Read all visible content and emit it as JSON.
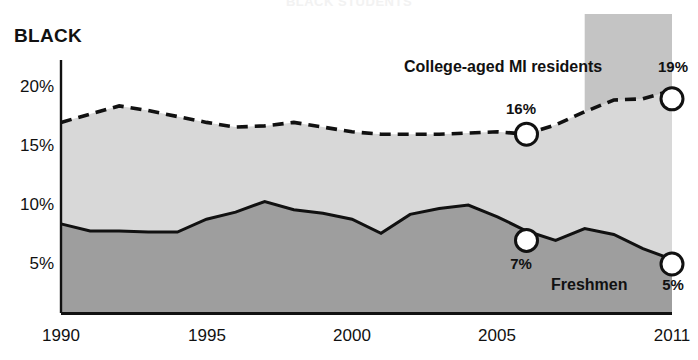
{
  "chart_data": {
    "type": "area",
    "title": "BLACK STUDENTS",
    "group_label": "BLACK",
    "xlabel": "",
    "ylabel": "",
    "x": [
      1990,
      1991,
      1992,
      1993,
      1994,
      1995,
      1996,
      1997,
      1998,
      1999,
      2000,
      2001,
      2002,
      2003,
      2004,
      2005,
      2006,
      2007,
      2008,
      2009,
      2010,
      2011
    ],
    "xlim": [
      1990,
      2011
    ],
    "ylim": [
      0,
      22
    ],
    "yticks": [
      5,
      10,
      15,
      20
    ],
    "ytick_labels": [
      "5%",
      "10%",
      "15%",
      "20%"
    ],
    "xticks": [
      1990,
      1995,
      2000,
      2005,
      2011
    ],
    "xtick_labels": [
      "1990",
      "1995",
      "2000",
      "2005",
      "2011"
    ],
    "grid": false,
    "legend_position": "inline-annotations",
    "series": [
      {
        "name": "College-aged MI residents",
        "style": "dashed",
        "color": "#111111",
        "fill": "#d8d8d8",
        "values": [
          17.0,
          17.7,
          18.4,
          18.0,
          17.5,
          17.0,
          16.6,
          16.7,
          17.0,
          16.6,
          16.2,
          16.0,
          16.0,
          16.0,
          16.1,
          16.2,
          16.0,
          16.8,
          17.9,
          18.9,
          19.0,
          19.7
        ]
      },
      {
        "name": "Freshmen",
        "style": "solid",
        "color": "#111111",
        "fill": "#9e9e9e",
        "values": [
          8.4,
          7.8,
          7.8,
          7.7,
          7.7,
          8.8,
          9.4,
          10.3,
          9.6,
          9.3,
          8.8,
          7.6,
          9.2,
          9.7,
          10.0,
          9.0,
          7.8,
          7.0,
          8.0,
          7.5,
          6.3,
          5.4
        ]
      }
    ],
    "annotations": [
      {
        "name": "college-2006-marker",
        "series": "College-aged MI residents",
        "x": 2006,
        "value": 16,
        "label": "16%",
        "label_position": "above"
      },
      {
        "name": "college-2011-marker",
        "series": "College-aged MI residents",
        "x": 2011,
        "value": 19,
        "label": "19%",
        "label_position": "above-right"
      },
      {
        "name": "freshmen-2006-marker",
        "series": "Freshmen",
        "x": 2006,
        "value": 7,
        "label": "7%",
        "label_position": "below"
      },
      {
        "name": "freshmen-2011-marker",
        "series": "Freshmen",
        "x": 2011,
        "value": 5,
        "label": "5%",
        "label_position": "below-right"
      }
    ],
    "series_labels": [
      {
        "name": "college-series-label",
        "text": "College-aged MI residents"
      },
      {
        "name": "freshmen-series-label",
        "text": "Freshmen"
      }
    ],
    "highlight_band": {
      "name": "recent-years-band",
      "from": 2008,
      "to": 2011,
      "color": "#c4c4c4"
    },
    "colors": {
      "upper_fill": "#d8d8d8",
      "lower_fill": "#9e9e9e",
      "line": "#111111",
      "band": "#c4c4c4",
      "axis": "#111111",
      "marker_fill": "#ffffff"
    }
  }
}
